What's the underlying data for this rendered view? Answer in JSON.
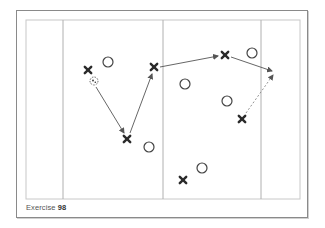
{
  "caption": {
    "label": "Exercise",
    "number": "98"
  },
  "field": {
    "outline_color": "#c8c8c8",
    "line_color": "#b0b0b0",
    "left": 26,
    "top": 20,
    "right": 300,
    "bottom": 199,
    "vertical_lines_x": [
      63,
      163,
      261
    ]
  },
  "players": {
    "attackers": [
      {
        "id": "x1",
        "x": 88,
        "y": 70
      },
      {
        "id": "x2",
        "x": 127,
        "y": 139
      },
      {
        "id": "x3",
        "x": 154,
        "y": 67
      },
      {
        "id": "x4",
        "x": 225,
        "y": 55
      },
      {
        "id": "x5",
        "x": 242,
        "y": 119
      },
      {
        "id": "x6",
        "x": 183,
        "y": 180
      }
    ],
    "defenders": [
      {
        "id": "o1",
        "x": 108,
        "y": 62
      },
      {
        "id": "o2",
        "x": 149,
        "y": 147
      },
      {
        "id": "o3",
        "x": 252,
        "y": 53
      },
      {
        "id": "o4",
        "x": 185,
        "y": 84
      },
      {
        "id": "o5",
        "x": 227,
        "y": 101
      },
      {
        "id": "o6",
        "x": 202,
        "y": 168
      }
    ],
    "ball": {
      "x": 94,
      "y": 81
    }
  },
  "arrows": [
    {
      "type": "pass",
      "style": "solid",
      "from": [
        96,
        87
      ],
      "to": [
        124,
        133
      ]
    },
    {
      "type": "pass",
      "style": "solid",
      "from": [
        130,
        133
      ],
      "to": [
        152,
        74
      ]
    },
    {
      "type": "pass",
      "style": "solid",
      "from": [
        160,
        67
      ],
      "to": [
        218,
        56
      ]
    },
    {
      "type": "pass",
      "style": "solid",
      "from": [
        231,
        57
      ],
      "to": [
        272,
        71
      ]
    },
    {
      "type": "run",
      "style": "dashed",
      "from": [
        246,
        113
      ],
      "to": [
        273,
        75
      ]
    }
  ]
}
